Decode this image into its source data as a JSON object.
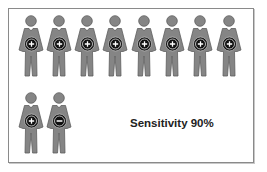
{
  "diagram": {
    "title": "Sensitivity 90%",
    "caption": "Sensitivity 90%",
    "colors": {
      "figure_fill": "#858585",
      "figure_stroke": "#5e5e5e",
      "badge_fill": "#111111",
      "badge_symbol": "#ffffff",
      "frame_border": "#8a8a8a",
      "text": "#222222"
    },
    "rows": [
      {
        "figures": [
          {
            "badge": "plus",
            "label": "positive"
          },
          {
            "badge": "plus",
            "label": "positive"
          },
          {
            "badge": "plus",
            "label": "positive"
          },
          {
            "badge": "plus",
            "label": "positive"
          },
          {
            "badge": "plus",
            "label": "positive"
          },
          {
            "badge": "plus",
            "label": "positive"
          },
          {
            "badge": "plus",
            "label": "positive"
          },
          {
            "badge": "plus",
            "label": "positive"
          }
        ]
      },
      {
        "figures": [
          {
            "badge": "plus",
            "label": "positive"
          },
          {
            "badge": "minus",
            "label": "negative"
          }
        ]
      }
    ],
    "counts": {
      "total": 10,
      "positive": 9,
      "negative": 1
    }
  }
}
